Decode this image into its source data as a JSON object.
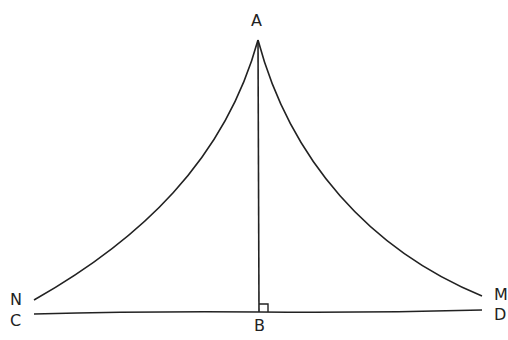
{
  "diagram": {
    "labels": {
      "A": "A",
      "B": "B",
      "C": "C",
      "D": "D",
      "M": "M",
      "N": "N"
    },
    "stroke_color": "#222222",
    "background": "#ffffff",
    "right_angle_at": "B"
  }
}
